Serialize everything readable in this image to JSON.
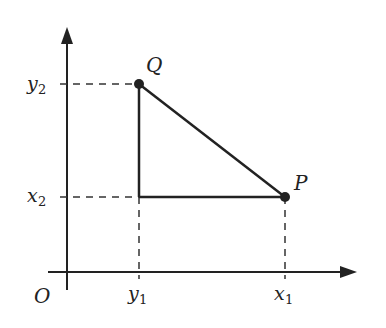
{
  "diagram": {
    "type": "coordinate-geometry",
    "origin_label": "O",
    "points": {
      "Q": {
        "label": "Q",
        "x_label": "y",
        "x_sub": "1",
        "y_label": "y",
        "y_sub": "2"
      },
      "P": {
        "label": "P",
        "x_label": "x",
        "x_sub": "1",
        "y_label": "x",
        "y_sub": "2"
      }
    },
    "axis_ticks": {
      "x": [
        {
          "main": "y",
          "sub": "1"
        },
        {
          "main": "x",
          "sub": "1"
        }
      ],
      "y": [
        {
          "main": "y",
          "sub": "2"
        },
        {
          "main": "x",
          "sub": "2"
        }
      ]
    },
    "colors": {
      "line": "#222222",
      "background": "#ffffff"
    }
  }
}
